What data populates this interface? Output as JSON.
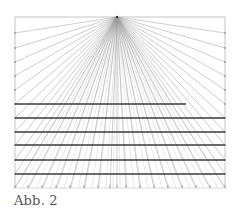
{
  "caption": "Abb. 2",
  "figure": {
    "type": "one-point-perspective-grid",
    "frame": {
      "left": 15,
      "top": 17,
      "right": 225,
      "bottom": 188
    },
    "vanishing_point": {
      "x": 117,
      "y": 17
    },
    "left_edge_points_y": [
      33,
      48,
      62,
      76,
      90,
      104,
      118,
      132,
      145,
      160,
      174
    ],
    "right_edge_points_y": [
      33,
      48,
      62,
      76,
      90,
      104,
      118,
      132,
      145,
      160,
      174
    ],
    "bottom_points_x": [
      15,
      28,
      42,
      56,
      70,
      84,
      98,
      110,
      117,
      126,
      140,
      154,
      168,
      182,
      196,
      210,
      225
    ],
    "top_points_x": [
      15,
      40,
      65,
      90,
      145,
      170,
      195,
      225
    ],
    "horizontal_lines": [
      {
        "y": 104,
        "x1": 15,
        "x2": 186
      },
      {
        "y": 118,
        "x1": 15,
        "x2": 225
      },
      {
        "y": 132,
        "x1": 15,
        "x2": 225
      },
      {
        "y": 145,
        "x1": 15,
        "x2": 225
      },
      {
        "y": 160,
        "x1": 15,
        "x2": 225
      },
      {
        "y": 174,
        "x1": 15,
        "x2": 225
      }
    ],
    "colors": {
      "ray": "#9a9a9a",
      "frame": "#b5b5b5",
      "horizontal": "#3a3a3a"
    }
  }
}
